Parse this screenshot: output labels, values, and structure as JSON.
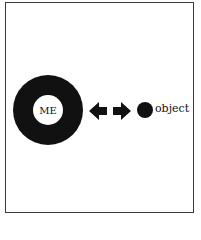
{
  "diagram": {
    "self_label": "ME",
    "object_label": "object",
    "relation": "bidirectional-arrows",
    "colors": {
      "ink": "#111111",
      "background": "#ffffff",
      "frame": "#3a3a3a"
    }
  }
}
